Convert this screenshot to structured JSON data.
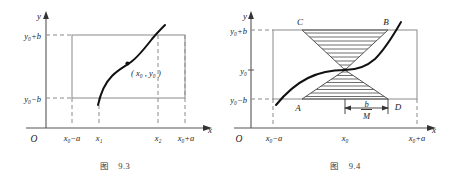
{
  "figures": [
    {
      "id": "fig-9-3",
      "caption_label": "图",
      "caption_number": "9.3",
      "axis": {
        "y_label": "y",
        "x_label": "x",
        "origin_label": "O"
      },
      "y_ticks": [
        {
          "key": "y0plusb",
          "text": "y₀+b",
          "value": "y0+b"
        },
        {
          "key": "y0minusb",
          "text": "y₀−b",
          "value": "y0-b"
        }
      ],
      "x_ticks": [
        {
          "key": "x0minusa",
          "text": "x₀−a"
        },
        {
          "key": "x1",
          "text": "x₁"
        },
        {
          "key": "x2",
          "text": "x₂"
        },
        {
          "key": "x0plusa",
          "text": "x₀+a"
        }
      ],
      "point_label": "( x₀ , y₀ )",
      "curve_name": "solution-curve",
      "rectangle_name": "region-rectangle"
    },
    {
      "id": "fig-9-4",
      "caption_label": "图",
      "caption_number": "9.4",
      "axis": {
        "y_label": "y",
        "x_label": "x",
        "origin_label": "O"
      },
      "y_ticks": [
        {
          "key": "y0plusb",
          "text": "y₀+b"
        },
        {
          "key": "y0",
          "text": "y₀"
        },
        {
          "key": "y0minusb",
          "text": "y₀−b"
        }
      ],
      "x_ticks": [
        {
          "key": "x0minusa",
          "text": "x₀−a"
        },
        {
          "key": "x0",
          "text": "x₀"
        },
        {
          "key": "x0plusa",
          "text": "x₀+a"
        }
      ],
      "vertex_labels": [
        {
          "key": "C",
          "text": "C",
          "position": "top-left"
        },
        {
          "key": "B",
          "text": "B",
          "position": "top-right"
        },
        {
          "key": "A",
          "text": "A",
          "position": "bottom-left"
        },
        {
          "key": "D",
          "text": "D",
          "position": "bottom-right"
        }
      ],
      "measure": {
        "numerator": "b",
        "denominator": "M"
      },
      "cone_name": "hatched-bowtie-region",
      "curve_name": "solution-curve"
    }
  ],
  "colors": {
    "curve": "#1a1a1a",
    "axis": "#555555",
    "rect": "#8a8a8a",
    "dashed": "#8a8a8a",
    "hatch": "#4a4a4a",
    "text": "#222222",
    "background": "#ffffff"
  }
}
